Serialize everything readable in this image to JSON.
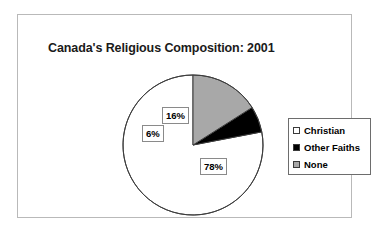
{
  "chart": {
    "title": "Canada's Religious Composition: 2001",
    "frame_border_color": "#b9b9b9",
    "background_color": "#ffffff"
  },
  "chart_data": {
    "type": "pie",
    "title": "Canada's Religious Composition: 2001",
    "xlabel": "",
    "ylabel": "",
    "categories": [
      "Christian",
      "Other Faiths",
      "None"
    ],
    "values": [
      78,
      6,
      16
    ],
    "value_labels": [
      "78%",
      "6%",
      "16%"
    ],
    "unit": "percent",
    "slice_colors": [
      "#ffffff",
      "#000000",
      "#a8a8a8"
    ],
    "slice_outline_color": "#3d3d3d",
    "start_angle_deg": 90,
    "direction": "counterclockwise",
    "legend_position": "right",
    "grid": false,
    "slices": [
      {
        "name": "None",
        "value": 16,
        "label": "16%",
        "color": "#a8a8a8"
      },
      {
        "name": "Other Faiths",
        "value": 6,
        "label": "6%",
        "color": "#000000"
      },
      {
        "name": "Christian",
        "value": 78,
        "label": "78%",
        "color": "#ffffff"
      }
    ]
  },
  "legend": {
    "items": [
      {
        "label": "Christian",
        "swatch_color": "#ffffff"
      },
      {
        "label": "Other Faiths",
        "swatch_color": "#000000"
      },
      {
        "label": "None",
        "swatch_color": "#a8a8a8"
      }
    ]
  }
}
